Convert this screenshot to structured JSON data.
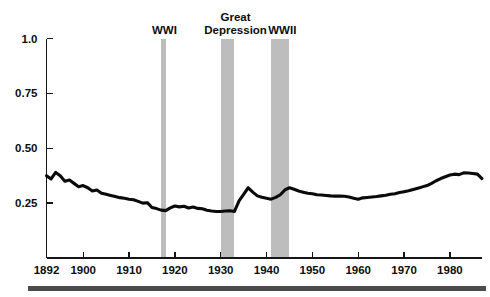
{
  "chart_data": {
    "type": "line",
    "title": "",
    "xlabel": "",
    "ylabel": "",
    "xlim": [
      1892,
      1987
    ],
    "ylim": [
      0.0,
      1.0
    ],
    "grid": false,
    "legend_position": "none",
    "y_ticks": [
      "1.0",
      "0.75",
      "0.50",
      "0.25"
    ],
    "y_tick_values": [
      1.0,
      0.75,
      0.5,
      0.25
    ],
    "x_ticks": [
      "1892",
      "1900",
      "1910",
      "1920",
      "1930",
      "1940",
      "1950",
      "1960",
      "1970",
      "1980"
    ],
    "x_tick_values": [
      1892,
      1900,
      1910,
      1920,
      1930,
      1940,
      1950,
      1960,
      1970,
      1980
    ],
    "annotations": [
      {
        "label": "WWI",
        "start": 1917,
        "end": 1918,
        "label_x": 1917.5
      },
      {
        "label": "Great\nDepression",
        "label_line1": "Great",
        "label_line2": "Depression",
        "start": 1930,
        "end": 1933,
        "label_x": 1931.5
      },
      {
        "label": "WWII",
        "start": 1941,
        "end": 1945,
        "label_x": 1943.0
      }
    ],
    "series": [
      {
        "name": "share",
        "x": [
          1892,
          1893,
          1894,
          1895,
          1896,
          1897,
          1898,
          1899,
          1900,
          1901,
          1902,
          1903,
          1904,
          1905,
          1906,
          1907,
          1908,
          1909,
          1910,
          1911,
          1912,
          1913,
          1914,
          1915,
          1916,
          1917,
          1918,
          1919,
          1920,
          1921,
          1922,
          1923,
          1924,
          1925,
          1926,
          1927,
          1928,
          1929,
          1930,
          1931,
          1932,
          1933,
          1934,
          1935,
          1936,
          1937,
          1938,
          1939,
          1940,
          1941,
          1942,
          1943,
          1944,
          1945,
          1946,
          1947,
          1948,
          1949,
          1950,
          1951,
          1952,
          1953,
          1954,
          1955,
          1956,
          1957,
          1958,
          1959,
          1960,
          1961,
          1962,
          1963,
          1964,
          1965,
          1966,
          1967,
          1968,
          1969,
          1970,
          1971,
          1972,
          1973,
          1974,
          1975,
          1976,
          1977,
          1978,
          1979,
          1980,
          1981,
          1982,
          1983,
          1984,
          1985,
          1986,
          1987
        ],
        "y": [
          0.375,
          0.36,
          0.39,
          0.375,
          0.35,
          0.355,
          0.34,
          0.325,
          0.33,
          0.32,
          0.305,
          0.31,
          0.295,
          0.29,
          0.285,
          0.28,
          0.275,
          0.272,
          0.268,
          0.265,
          0.258,
          0.25,
          0.252,
          0.23,
          0.225,
          0.218,
          0.216,
          0.228,
          0.237,
          0.233,
          0.236,
          0.228,
          0.232,
          0.226,
          0.224,
          0.218,
          0.214,
          0.212,
          0.212,
          0.214,
          0.215,
          0.212,
          0.26,
          0.29,
          0.32,
          0.3,
          0.283,
          0.277,
          0.272,
          0.268,
          0.276,
          0.288,
          0.31,
          0.32,
          0.313,
          0.305,
          0.3,
          0.295,
          0.293,
          0.288,
          0.287,
          0.285,
          0.283,
          0.282,
          0.282,
          0.281,
          0.278,
          0.272,
          0.268,
          0.274,
          0.276,
          0.278,
          0.28,
          0.283,
          0.286,
          0.29,
          0.293,
          0.298,
          0.302,
          0.306,
          0.312,
          0.318,
          0.324,
          0.33,
          0.34,
          0.352,
          0.362,
          0.37,
          0.378,
          0.382,
          0.38,
          0.388,
          0.387,
          0.385,
          0.382,
          0.362
        ]
      }
    ]
  },
  "band_color": "#bdbdbd",
  "line_color": "#0a0a0a",
  "axis_color": "#161616",
  "footer_bar_color": "#4b4b4b",
  "background_color": "#ffffff"
}
